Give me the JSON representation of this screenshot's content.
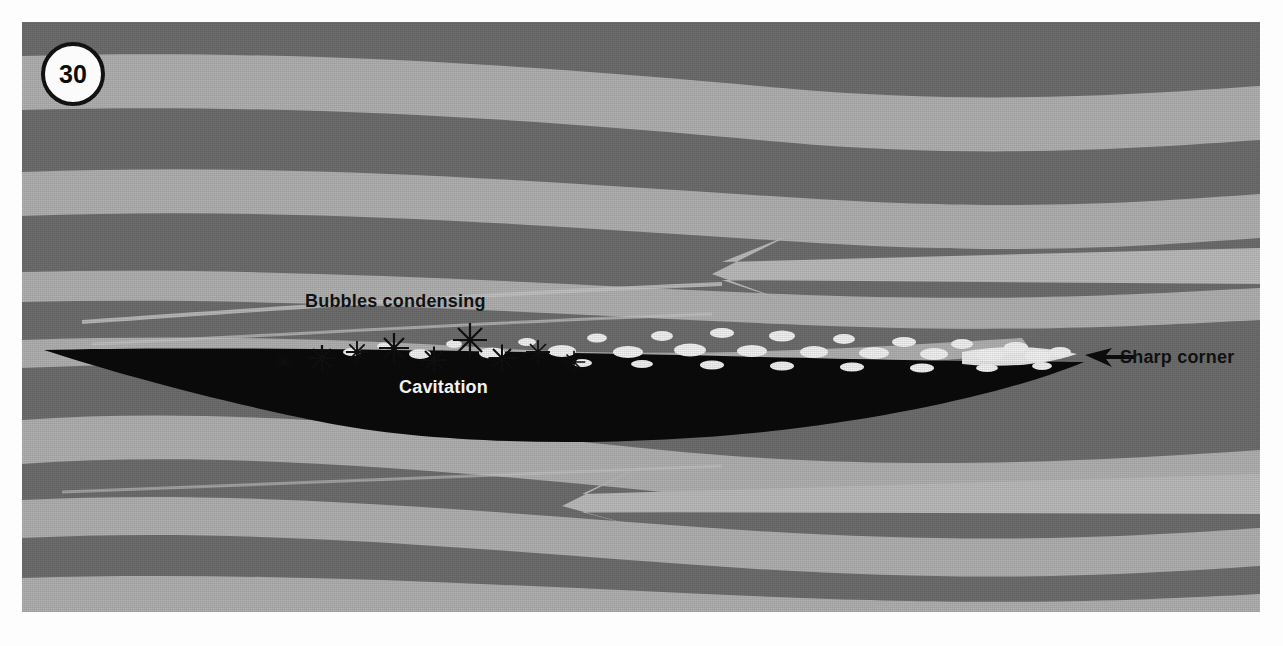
{
  "figure": {
    "number": "30",
    "background_color": "#6f6f6f",
    "stream_light_color": "#b2b2b2",
    "stream_dark_color": "#6f6f6f",
    "foil_color": "#0b0b0b",
    "bubble_color": "#f5f5f5",
    "arrow_color": "#b9b9b9"
  },
  "labels": {
    "bubbles_condensing": "Bubbles condensing",
    "cavitation": "Cavitation",
    "sharp_corner": "Sharp corner"
  },
  "annotations": {
    "sharp_corner_arrow": "left-arrow-icon",
    "flow_arrow_upper": "flow-arrow-left-icon",
    "flow_arrow_lower": "flow-arrow-left-icon"
  }
}
